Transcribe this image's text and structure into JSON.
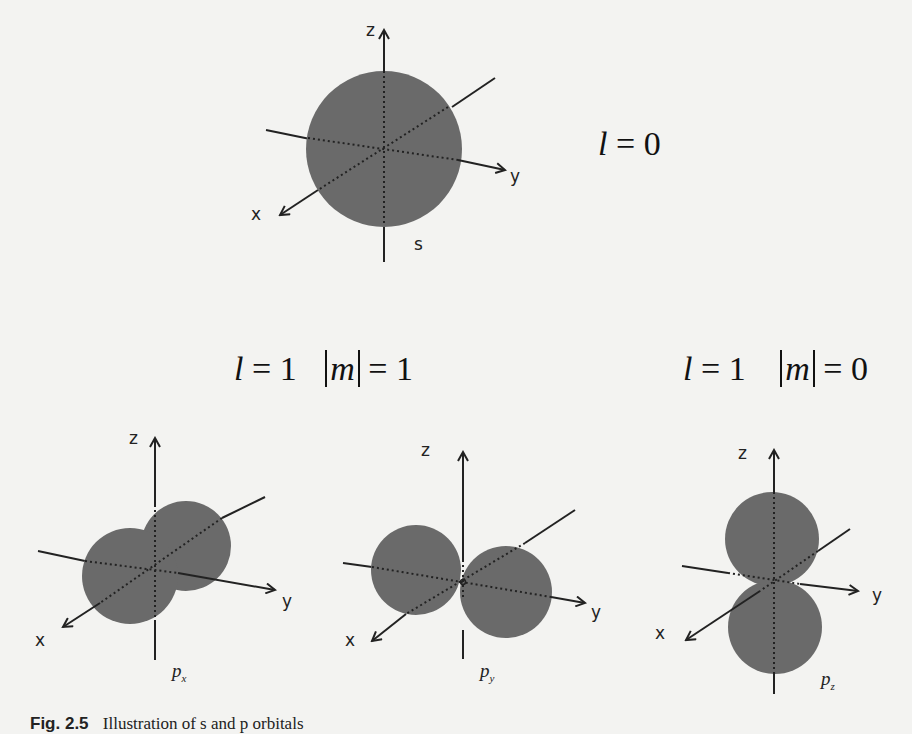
{
  "figure": {
    "caption_label": "Fig. 2.5",
    "caption_text": "Illustration of s and p orbitals",
    "colors": {
      "background": "#f3f3f1",
      "lobe": "#6a6a6a",
      "axis": "#222222"
    }
  },
  "s_orbital": {
    "quantum_label_l": "l",
    "quantum_label_value": "= 0",
    "axis_labels": {
      "z": "z",
      "y": "y",
      "x": "x"
    },
    "name": "s"
  },
  "p_group_m1": {
    "l_label": "l",
    "l_value": "= 1",
    "m_label": "m",
    "m_value": "= 1"
  },
  "p_group_m0": {
    "l_label": "l",
    "l_value": "= 1",
    "m_label": "m",
    "m_value": "= 0"
  },
  "px": {
    "axis_labels": {
      "z": "z",
      "y": "y",
      "x": "x"
    },
    "name": "p",
    "sub": "x"
  },
  "py": {
    "axis_labels": {
      "z": "z",
      "y": "y",
      "x": "x"
    },
    "name": "p",
    "sub": "y"
  },
  "pz": {
    "axis_labels": {
      "z": "z",
      "y": "y",
      "x": "x"
    },
    "name": "p",
    "sub": "z"
  }
}
